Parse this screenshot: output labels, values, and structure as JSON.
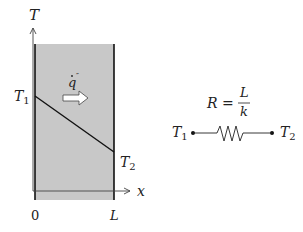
{
  "diagram": {
    "wall": {
      "fill": "#c8c8c8",
      "axis_y_label": "T",
      "axis_x_label": "x",
      "x_start_label": "0",
      "x_end_label": "L",
      "left_temp_label": "T",
      "left_temp_sub": "1",
      "right_temp_label": "T",
      "right_temp_sub": "2",
      "heat_flux_label": "q",
      "heat_flux_marks": "˙ ˝"
    },
    "circuit": {
      "resistance_label": "R =",
      "numerator": "L",
      "denominator": "k",
      "left_node_label": "T",
      "left_node_sub": "1",
      "right_node_label": "T",
      "right_node_sub": "2"
    }
  }
}
